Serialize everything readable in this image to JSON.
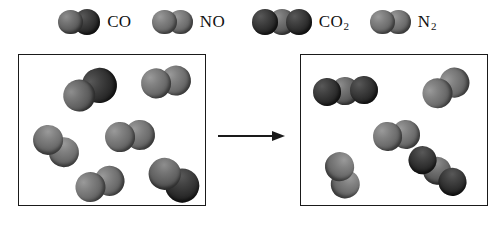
{
  "diagram": {
    "arrow_name": "reaction-arrow",
    "background_color": "#ffffff",
    "border_color": "#1a1a1a"
  },
  "legend": {
    "entries": [
      {
        "id": "co",
        "label": "CO",
        "label_main": "CO",
        "label_sub": "",
        "atom_count": 2,
        "shape": "diatomic",
        "colors": [
          "#6e6e6e",
          "#1e1e1e"
        ],
        "x": 58,
        "y": 8
      },
      {
        "id": "no",
        "label": "NO",
        "label_main": "NO",
        "label_sub": "",
        "atom_count": 2,
        "shape": "diatomic",
        "colors": [
          "#6e6e6e",
          "#6e6e6e"
        ],
        "x": 152,
        "y": 8
      },
      {
        "id": "co2",
        "label": "CO2",
        "label_main": "CO",
        "label_sub": "2",
        "atom_count": 3,
        "shape": "triatomic",
        "colors": [
          "#3a3a3a",
          "#757575",
          "#1e1e1e"
        ],
        "x": 252,
        "y": 8
      },
      {
        "id": "n2",
        "label": "N2",
        "label_main": "N",
        "label_sub": "2",
        "atom_count": 2,
        "shape": "diatomic",
        "colors": [
          "#6e6e6e",
          "#6e6e6e"
        ],
        "x": 370,
        "y": 8
      }
    ]
  },
  "boxes": [
    {
      "id": "reactants",
      "name": "reactant-box",
      "x": 18,
      "y": 54,
      "width": 188,
      "height": 152,
      "molecule_count": 6,
      "composition": [
        {
          "species": "CO",
          "count": 2
        },
        {
          "species": "NO",
          "count": 4
        }
      ],
      "molecules": [
        {
          "species": "CO",
          "x": 43,
          "y": 18,
          "rotation": -28,
          "scale": 1.08
        },
        {
          "species": "NO",
          "x": 122,
          "y": 12,
          "rotation": -8,
          "scale": 1.0
        },
        {
          "species": "NO",
          "x": 86,
          "y": 66,
          "rotation": -6,
          "scale": 1.0
        },
        {
          "species": "NO",
          "x": 12,
          "y": 76,
          "rotation": 38,
          "scale": 1.0
        },
        {
          "species": "NO",
          "x": 56,
          "y": 114,
          "rotation": -18,
          "scale": 1.0
        },
        {
          "species": "CO",
          "x": 128,
          "y": 108,
          "rotation": 34,
          "scale": 1.05
        }
      ]
    },
    {
      "id": "products",
      "name": "product-box",
      "x": 300,
      "y": 54,
      "width": 188,
      "height": 152,
      "molecule_count": 5,
      "composition": [
        {
          "species": "CO2",
          "count": 2
        },
        {
          "species": "N2",
          "count": 3
        }
      ],
      "molecules": [
        {
          "species": "CO2",
          "x": 12,
          "y": 22,
          "rotation": -3,
          "scale": 1.0
        },
        {
          "species": "N2",
          "x": 120,
          "y": 18,
          "rotation": -32,
          "scale": 1.0
        },
        {
          "species": "N2",
          "x": 72,
          "y": 66,
          "rotation": -6,
          "scale": 0.95
        },
        {
          "species": "N2",
          "x": 18,
          "y": 106,
          "rotation": 72,
          "scale": 0.95
        },
        {
          "species": "CO2",
          "x": 104,
          "y": 102,
          "rotation": 36,
          "scale": 1.0
        }
      ]
    }
  ],
  "species_defs": {
    "CO": {
      "atoms": [
        {
          "tone": "mid",
          "r": 15
        },
        {
          "tone": "dark",
          "r": 16
        }
      ]
    },
    "NO": {
      "atoms": [
        {
          "tone": "gray",
          "r": 15
        },
        {
          "tone": "gray",
          "r": 15
        }
      ]
    },
    "CO2": {
      "atoms": [
        {
          "tone": "dark",
          "r": 14
        },
        {
          "tone": "mid",
          "r": 14
        },
        {
          "tone": "dark",
          "r": 14
        }
      ]
    },
    "N2": {
      "atoms": [
        {
          "tone": "gray",
          "r": 15
        },
        {
          "tone": "gray",
          "r": 15
        }
      ]
    }
  },
  "chart_data": {
    "type": "diagram",
    "legend_entries": [
      "CO",
      "NO",
      "CO2",
      "N2"
    ],
    "reactants": {
      "CO": 2,
      "NO": 4
    },
    "products": {
      "CO2": 2,
      "N2": 3
    }
  }
}
